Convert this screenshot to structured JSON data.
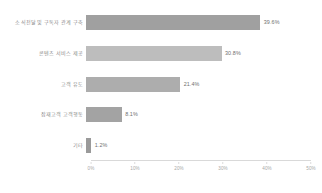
{
  "chart_data": {
    "type": "bar",
    "orientation": "horizontal",
    "title": "",
    "xlabel": "",
    "ylabel": "",
    "xlim": [
      0,
      50
    ],
    "grid": false,
    "legend": false,
    "categories": [
      "소식전달 및 구독자 관계 구축",
      "콘텐츠 서비스 제공",
      "고객 유도",
      "잠재고객 고객행동",
      "기타"
    ],
    "values": [
      39.6,
      30.8,
      21.4,
      8.1,
      1.2
    ],
    "value_labels": [
      "39.6%",
      "30.8%",
      "21.4%",
      "8.1%",
      "1.2%"
    ],
    "bar_colors": [
      "#a0a0a0",
      "#bdbdbd",
      "#adadad",
      "#a3a3a3",
      "#9a9a9a"
    ],
    "xticks": [
      0,
      10,
      20,
      30,
      40,
      50
    ],
    "xtick_labels": [
      "0%",
      "10%",
      "20%",
      "30%",
      "40%",
      "50%"
    ]
  }
}
